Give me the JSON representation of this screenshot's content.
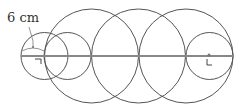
{
  "diagram": {
    "radius_label": "6 cm",
    "stroke_color": "#555555",
    "line_color": "#888888",
    "axis": {
      "x1": 21,
      "x2": 233,
      "y": 56
    },
    "small_circles": [
      {
        "cx": 44.5,
        "cy": 56,
        "r": 23.5
      },
      {
        "cx": 67.5,
        "cy": 56,
        "r": 23.5
      },
      {
        "cx": 209.5,
        "cy": 56,
        "r": 23.5
      }
    ],
    "large_circles": [
      {
        "cx": 91.5,
        "cy": 56,
        "r": 47
      },
      {
        "cx": 138.5,
        "cy": 56,
        "r": 47
      },
      {
        "cx": 186,
        "cy": 56,
        "r": 47
      }
    ]
  }
}
